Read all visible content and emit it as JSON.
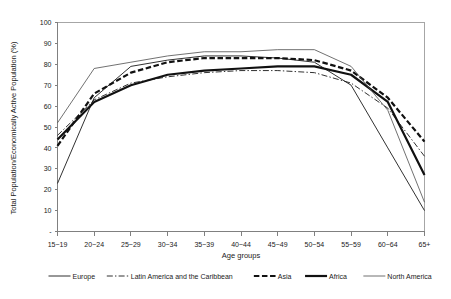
{
  "chart_data": {
    "type": "line",
    "title": "",
    "xlabel": "Age groups",
    "ylabel": "Total Population/Economically Active Population (%)",
    "categories": [
      "15~19",
      "20~24",
      "25~29",
      "30~34",
      "35~39",
      "40~44",
      "45~49",
      "50~54",
      "55~59",
      "60~64",
      "65+"
    ],
    "ylim": [
      0,
      100
    ],
    "yticks": [
      0,
      10,
      20,
      30,
      40,
      50,
      60,
      70,
      80,
      90,
      100
    ],
    "ytick_labels": [
      "-",
      "10",
      "20",
      "30",
      "40",
      "50",
      "60",
      "70",
      "80",
      "90",
      "100"
    ],
    "grid": false,
    "legend_position": "bottom",
    "series": [
      {
        "name": "Europe",
        "style": "thin-solid",
        "color": "#1a1a1a",
        "values": [
          23,
          64,
          79,
          82,
          84,
          84,
          83,
          81,
          70,
          40,
          10
        ]
      },
      {
        "name": "Latin America and the Caribbean",
        "style": "dash-dot",
        "color": "#1a1a1a",
        "values": [
          46,
          63,
          71,
          74,
          76,
          77,
          77,
          76,
          71,
          59,
          36
        ]
      },
      {
        "name": "Asia",
        "style": "heavy-dashed",
        "color": "#111111",
        "values": [
          41,
          66,
          76,
          81,
          83,
          83,
          83,
          82,
          77,
          64,
          43
        ]
      },
      {
        "name": "Africa",
        "style": "heavy-solid",
        "color": "#111111",
        "values": [
          44,
          62,
          70,
          75,
          77,
          78,
          79,
          79,
          75,
          62,
          27
        ]
      },
      {
        "name": "North America",
        "style": "thin-solid-light",
        "color": "#4d4d4d",
        "values": [
          52,
          78,
          81,
          84,
          86,
          86,
          87,
          87,
          79,
          58,
          14
        ]
      }
    ]
  },
  "legend": {
    "items": [
      {
        "label": "Europe"
      },
      {
        "label": "Latin America and the Caribbean"
      },
      {
        "label": "Asia"
      },
      {
        "label": "Africa"
      },
      {
        "label": "North America"
      }
    ]
  }
}
